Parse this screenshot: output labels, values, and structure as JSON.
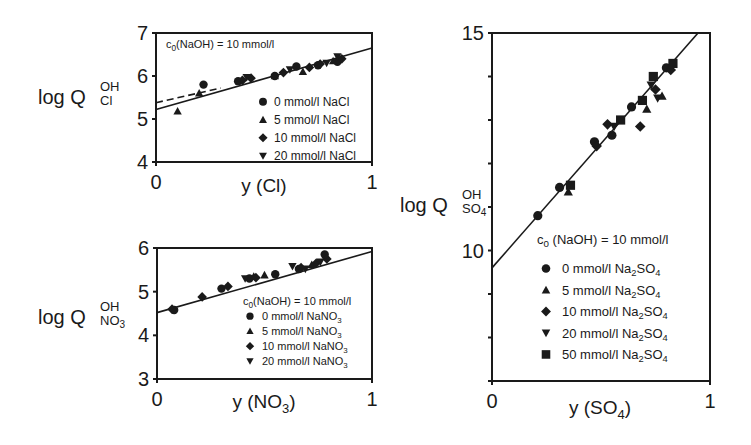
{
  "chart_data": [
    {
      "id": "cl",
      "type": "scatter",
      "title": "",
      "xlabel": "y (Cl)",
      "ylabel": "log Q_Cl^OH",
      "ylabel_main": "log Q",
      "ylabel_sup": "OH",
      "ylabel_sub": "Cl",
      "xlim": [
        0,
        1
      ],
      "ylim": [
        4,
        7
      ],
      "xticks": [
        "0",
        "1"
      ],
      "yticks": [
        "4",
        "5",
        "6",
        "7"
      ],
      "grid": false,
      "legend_position": "lower right (inside)",
      "annotation": "c0(NaOH) = 10 mmol/l",
      "annotation_main": "c",
      "annotation_sub": "0",
      "annotation_rest": "(NaOH) = 10 mmol/l",
      "fit_line": {
        "style": "solid",
        "x": [
          0,
          1
        ],
        "y": [
          5.22,
          6.65
        ]
      },
      "fit_line_dashed": {
        "style": "dashed",
        "x": [
          0,
          0.3
        ],
        "y": [
          5.38,
          5.72
        ]
      },
      "series": [
        {
          "name": "0 mmol/l NaCl",
          "marker": "circle",
          "x": [
            0.22,
            0.38,
            0.55,
            0.65,
            0.75,
            0.84
          ],
          "y": [
            5.8,
            5.88,
            6.0,
            6.22,
            6.25,
            6.33
          ]
        },
        {
          "name": "5 mmol/l NaCl",
          "marker": "triangle-up",
          "x": [
            0.1,
            0.2,
            0.55,
            0.68,
            0.82
          ],
          "y": [
            5.18,
            5.6,
            6.0,
            6.1,
            6.35
          ]
        },
        {
          "name": "10 mmol/l NaCl",
          "marker": "diamond",
          "x": [
            0.4,
            0.44,
            0.59,
            0.71,
            0.76,
            0.86
          ],
          "y": [
            5.9,
            5.95,
            6.08,
            6.2,
            6.28,
            6.4
          ]
        },
        {
          "name": "20 mmol/l NaCl",
          "marker": "triangle-down",
          "x": [
            0.42,
            0.62,
            0.79,
            0.84
          ],
          "y": [
            5.97,
            6.15,
            6.3,
            6.45
          ]
        }
      ]
    },
    {
      "id": "no3",
      "type": "scatter",
      "title": "",
      "xlabel": "y (NO3)",
      "ylabel": "log Q_NO3^OH",
      "ylabel_main": "log Q",
      "ylabel_sup": "OH",
      "ylabel_sub": "NO3",
      "xlim": [
        0,
        1
      ],
      "ylim": [
        3,
        6
      ],
      "xticks": [
        "0",
        "1"
      ],
      "yticks": [
        "3",
        "4",
        "5",
        "6"
      ],
      "grid": false,
      "legend_position": "lower right (inside)",
      "annotation": "c0(NaOH) = 10 mmol/l",
      "annotation_main": "c",
      "annotation_sub": "0",
      "annotation_rest": "(NaOH) = 10 mmol/l",
      "fit_line": {
        "style": "solid",
        "x": [
          0,
          1
        ],
        "y": [
          4.52,
          5.92
        ]
      },
      "series": [
        {
          "name": "0 mmol/l NaNO3",
          "marker": "circle",
          "x": [
            0.08,
            0.3,
            0.43,
            0.55,
            0.66,
            0.78
          ],
          "y": [
            4.58,
            5.07,
            5.3,
            5.4,
            5.52,
            5.85
          ]
        },
        {
          "name": "5 mmol/l NaNO3",
          "marker": "triangle-up",
          "x": [
            0.45,
            0.5,
            0.72
          ],
          "y": [
            5.35,
            5.38,
            5.62
          ]
        },
        {
          "name": "10 mmol/l NaNO3",
          "marker": "diamond",
          "x": [
            0.07,
            0.21,
            0.33,
            0.46,
            0.67,
            0.74,
            0.79
          ],
          "y": [
            4.6,
            4.88,
            5.12,
            5.32,
            5.55,
            5.65,
            5.75
          ]
        },
        {
          "name": "20 mmol/l NaNO3",
          "marker": "triangle-down",
          "x": [
            0.41,
            0.63,
            0.69,
            0.76
          ],
          "y": [
            5.3,
            5.58,
            5.52,
            5.68
          ]
        }
      ]
    },
    {
      "id": "so4",
      "type": "scatter",
      "title": "",
      "xlabel": "y (SO4)",
      "ylabel": "log Q_SO4^OH",
      "ylabel_main": "log Q",
      "ylabel_sup": "OH",
      "ylabel_sub": "SO4",
      "xlim": [
        0,
        1
      ],
      "ylim": [
        7,
        15
      ],
      "xticks": [
        "0",
        "1"
      ],
      "yticks": [
        "10",
        "15"
      ],
      "ytick_minor_step": 1,
      "grid": false,
      "legend_position": "lower right (inside)",
      "annotation": "c0 (NaOH) = 10 mmol/l",
      "annotation_main": "c",
      "annotation_sub": "0",
      "annotation_rest": " (NaOH)  =  10 mmol/l",
      "fit_line": {
        "style": "solid",
        "x": [
          0,
          0.945
        ],
        "y": [
          9.6,
          15.0
        ]
      },
      "series": [
        {
          "name": "0 mmol/l Na2SO4",
          "marker": "circle",
          "x": [
            0.21,
            0.31,
            0.47,
            0.55,
            0.64,
            0.8
          ],
          "y": [
            10.8,
            11.45,
            12.5,
            12.65,
            13.3,
            14.2
          ]
        },
        {
          "name": "5 mmol/l Na2SO4",
          "marker": "triangle-up",
          "x": [
            0.35,
            0.71,
            0.78
          ],
          "y": [
            11.35,
            13.25,
            13.55
          ]
        },
        {
          "name": "10 mmol/l Na2SO4",
          "marker": "diamond",
          "x": [
            0.48,
            0.53,
            0.68,
            0.75,
            0.82
          ],
          "y": [
            12.4,
            12.9,
            12.85,
            13.7,
            14.15
          ]
        },
        {
          "name": "20 mmol/l Na2SO4",
          "marker": "triangle-down",
          "x": [
            0.56,
            0.73,
            0.76
          ],
          "y": [
            12.85,
            13.8,
            13.5
          ]
        },
        {
          "name": "50 mmol/l Na2SO4",
          "marker": "square",
          "x": [
            0.36,
            0.59,
            0.69,
            0.74,
            0.83
          ],
          "y": [
            11.5,
            13.0,
            13.45,
            14.0,
            14.3
          ]
        }
      ]
    }
  ]
}
